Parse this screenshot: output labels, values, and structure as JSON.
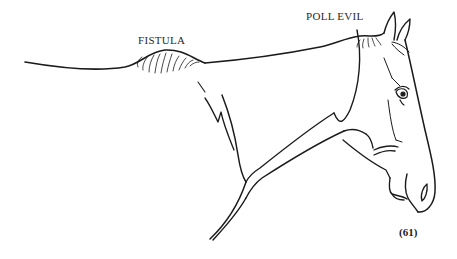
{
  "illustration": {
    "subject": "horse head and neck line drawing",
    "labels": {
      "fistula": "FISTULA",
      "poll_evil": "POLL EVIL"
    },
    "figure_number": "(61)"
  },
  "colors": {
    "ink": "#1a1a1a",
    "background": "#ffffff"
  }
}
